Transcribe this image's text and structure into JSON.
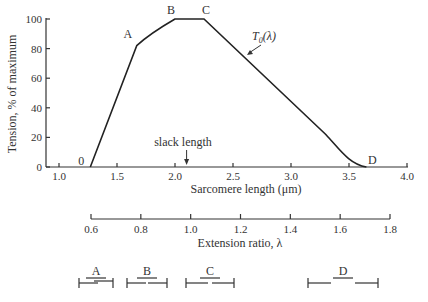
{
  "chart_data": {
    "type": "line",
    "title": "",
    "xlabel": "Sarcomere length (μm)",
    "ylabel": "Tension, % of maximum",
    "xlim": [
      0.9,
      4.0
    ],
    "ylim": [
      0,
      100
    ],
    "x_ticks": [
      1.0,
      1.5,
      2.0,
      2.5,
      3.0,
      3.5,
      4.0
    ],
    "x_tick_labels": [
      "1.0",
      "1.5",
      "2.0",
      "2.5",
      "3.0",
      "3.5",
      "4.0"
    ],
    "y_ticks": [
      0,
      20,
      40,
      60,
      80,
      100
    ],
    "y_tick_labels": [
      "0",
      "20",
      "40",
      "60",
      "80",
      "100"
    ],
    "grid": false,
    "series": [
      {
        "name": "T0(λ)",
        "x": [
          1.27,
          1.67,
          2.0,
          2.25,
          3.3,
          3.5,
          3.65
        ],
        "y": [
          0,
          82,
          100,
          100,
          22,
          7,
          0
        ]
      }
    ],
    "key_points": [
      {
        "label": "0",
        "x": 1.27,
        "y": 0
      },
      {
        "label": "A",
        "x": 1.67,
        "y": 82
      },
      {
        "label": "B",
        "x": 2.0,
        "y": 100
      },
      {
        "label": "C",
        "x": 2.25,
        "y": 100
      },
      {
        "label": "D",
        "x": 3.65,
        "y": 0
      }
    ],
    "annotations": [
      {
        "text": "slack length",
        "x": 2.1,
        "type": "arrow-down"
      },
      {
        "text": "T0(λ)",
        "target_x": 2.75,
        "type": "arrow-pointer"
      }
    ],
    "secondary_axis": {
      "label": "Extension ratio, λ",
      "ticks": [
        0.6,
        0.8,
        1.0,
        1.2,
        1.4,
        1.6,
        1.8
      ],
      "tick_labels": [
        "0.6",
        "0.8",
        "1.0",
        "1.2",
        "1.4",
        "1.6",
        "1.8"
      ]
    },
    "filament_diagrams": [
      {
        "label": "A"
      },
      {
        "label": "B"
      },
      {
        "label": "C"
      },
      {
        "label": "D"
      }
    ]
  },
  "labels": {
    "curve_name_main": "T",
    "curve_name_sub": "0",
    "curve_name_arg": "(λ)",
    "slack": "slack  length"
  }
}
